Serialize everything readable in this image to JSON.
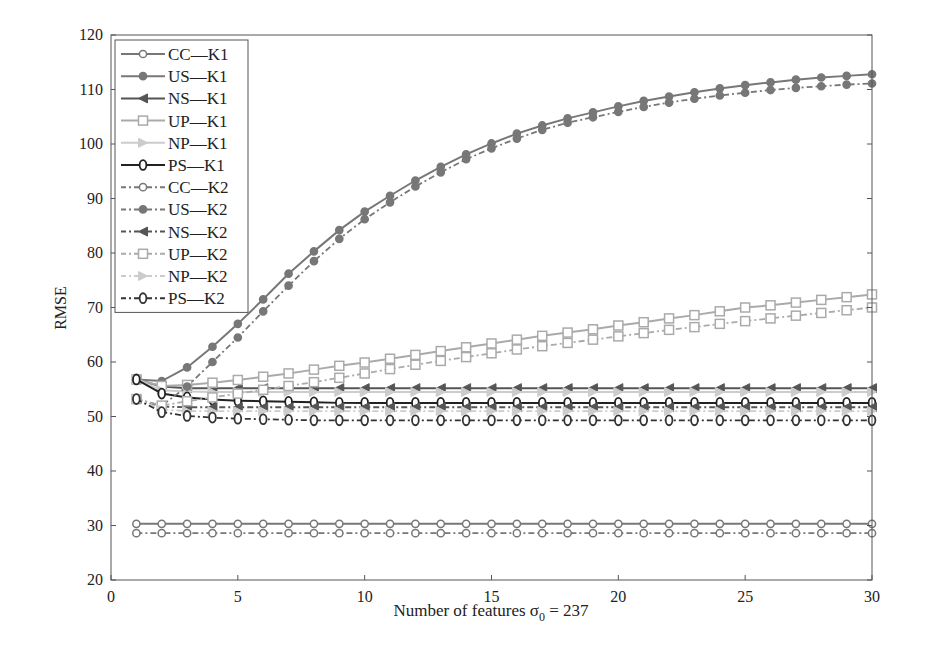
{
  "chart_data": {
    "type": "line",
    "title": "",
    "xlabel": "Number of features σ0 = 237",
    "ylabel": "RMSE",
    "xlim": [
      0,
      30
    ],
    "ylim": [
      20,
      120
    ],
    "xticks": [
      0,
      5,
      10,
      15,
      20,
      25,
      30
    ],
    "yticks": [
      20,
      30,
      40,
      50,
      60,
      70,
      80,
      90,
      100,
      110,
      120
    ],
    "grid": false,
    "legend_position": "upper left",
    "x": [
      1,
      2,
      3,
      4,
      5,
      6,
      7,
      8,
      9,
      10,
      11,
      12,
      13,
      14,
      15,
      16,
      17,
      18,
      19,
      20,
      21,
      22,
      23,
      24,
      25,
      26,
      27,
      28,
      29,
      30
    ],
    "series": [
      {
        "name": "CC—K1",
        "color": "#777",
        "dash": "",
        "marker": "circle",
        "values": [
          30.3,
          30.3,
          30.3,
          30.3,
          30.3,
          30.3,
          30.3,
          30.3,
          30.3,
          30.3,
          30.3,
          30.3,
          30.3,
          30.3,
          30.3,
          30.3,
          30.3,
          30.3,
          30.3,
          30.3,
          30.3,
          30.3,
          30.3,
          30.3,
          30.3,
          30.3,
          30.3,
          30.3,
          30.3,
          30.3
        ]
      },
      {
        "name": "US—K1",
        "color": "#777",
        "dash": "",
        "marker": "dot",
        "values": [
          56.8,
          56.5,
          59,
          62.8,
          67,
          71.5,
          76.2,
          80.3,
          84.2,
          87.6,
          90.5,
          93.3,
          95.8,
          98.1,
          100.1,
          101.9,
          103.4,
          104.7,
          105.8,
          106.9,
          107.9,
          108.7,
          109.5,
          110.2,
          110.8,
          111.3,
          111.8,
          112.2,
          112.5,
          112.8
        ]
      },
      {
        "name": "NS—K1",
        "color": "#555",
        "dash": "",
        "marker": "triangle-left",
        "values": [
          56.8,
          55.5,
          55.2,
          55.2,
          55.2,
          55.2,
          55.2,
          55.2,
          55.2,
          55.2,
          55.2,
          55.2,
          55.2,
          55.2,
          55.2,
          55.2,
          55.2,
          55.2,
          55.2,
          55.2,
          55.2,
          55.2,
          55.2,
          55.2,
          55.2,
          55.2,
          55.2,
          55.2,
          55.2,
          55.2
        ]
      },
      {
        "name": "UP—K1",
        "color": "#aaa",
        "dash": "",
        "marker": "square",
        "values": [
          56.8,
          55.6,
          55.8,
          56.2,
          56.7,
          57.3,
          57.9,
          58.6,
          59.3,
          59.9,
          60.6,
          61.3,
          62,
          62.7,
          63.4,
          64.1,
          64.8,
          65.4,
          66,
          66.7,
          67.3,
          68,
          68.6,
          69.3,
          70,
          70.4,
          70.9,
          71.4,
          71.9,
          72.4
        ]
      },
      {
        "name": "NP—K1",
        "color": "#ccc",
        "dash": "",
        "marker": "triangle-right",
        "values": [
          56.8,
          54.8,
          54.6,
          54.5,
          54.5,
          54.5,
          54.5,
          54.5,
          54.5,
          54.5,
          54.5,
          54.5,
          54.5,
          54.5,
          54.5,
          54.5,
          54.5,
          54.5,
          54.5,
          54.5,
          54.5,
          54.5,
          54.5,
          54.5,
          54.5,
          54.5,
          54.5,
          54.5,
          54.5,
          54.5
        ]
      },
      {
        "name": "PS—K1",
        "color": "#222",
        "dash": "",
        "marker": "diamond",
        "values": [
          56.8,
          54.2,
          53.5,
          53.1,
          52.9,
          52.8,
          52.7,
          52.6,
          52.5,
          52.5,
          52.5,
          52.5,
          52.5,
          52.5,
          52.5,
          52.5,
          52.5,
          52.5,
          52.5,
          52.5,
          52.5,
          52.5,
          52.5,
          52.5,
          52.5,
          52.5,
          52.5,
          52.5,
          52.5,
          52.5
        ]
      },
      {
        "name": "CC—K2",
        "color": "#777",
        "dash": "6,3,2,3",
        "marker": "circle",
        "values": [
          28.6,
          28.6,
          28.6,
          28.6,
          28.6,
          28.6,
          28.6,
          28.6,
          28.6,
          28.6,
          28.6,
          28.6,
          28.6,
          28.6,
          28.6,
          28.6,
          28.6,
          28.6,
          28.6,
          28.6,
          28.6,
          28.6,
          28.6,
          28.6,
          28.6,
          28.6,
          28.6,
          28.6,
          28.6,
          28.6
        ]
      },
      {
        "name": "US—K2",
        "color": "#777",
        "dash": "6,3,2,3",
        "marker": "dot",
        "values": [
          53.2,
          52,
          55.5,
          60,
          64.5,
          69.3,
          74,
          78.5,
          82.6,
          86.2,
          89.3,
          92.2,
          94.8,
          97.2,
          99.2,
          101,
          102.6,
          103.9,
          104.9,
          105.9,
          106.8,
          107.6,
          108.3,
          108.9,
          109.4,
          109.9,
          110.3,
          110.6,
          110.9,
          111.1
        ]
      },
      {
        "name": "NS—K2",
        "color": "#555",
        "dash": "6,3,2,3",
        "marker": "triangle-left",
        "values": [
          53.2,
          51.8,
          51.7,
          51.7,
          51.7,
          51.7,
          51.7,
          51.7,
          51.7,
          51.7,
          51.7,
          51.7,
          51.7,
          51.7,
          51.7,
          51.7,
          51.7,
          51.7,
          51.7,
          51.7,
          51.7,
          51.7,
          51.7,
          51.7,
          51.7,
          51.7,
          51.7,
          51.7,
          51.7,
          51.7
        ]
      },
      {
        "name": "UP—K2",
        "color": "#aaa",
        "dash": "6,3,2,3",
        "marker": "square",
        "values": [
          53.2,
          52,
          52.8,
          53.5,
          54.2,
          54.9,
          55.6,
          56.3,
          57.1,
          57.9,
          58.7,
          59.5,
          60.2,
          60.9,
          61.6,
          62.3,
          62.9,
          63.5,
          64.1,
          64.7,
          65.3,
          65.9,
          66.4,
          67,
          67.5,
          68,
          68.5,
          69,
          69.5,
          70
        ]
      },
      {
        "name": "NP—K2",
        "color": "#ccc",
        "dash": "6,3,2,3",
        "marker": "triangle-right",
        "values": [
          53.2,
          51.3,
          51,
          51,
          51,
          51,
          51,
          51,
          51,
          51,
          51,
          51,
          51,
          51,
          51,
          51,
          51,
          51,
          51,
          51,
          51,
          51,
          51,
          51,
          51,
          51,
          51,
          51,
          51,
          51
        ]
      },
      {
        "name": "PS—K2",
        "color": "#333",
        "dash": "6,3,2,3",
        "marker": "diamond",
        "values": [
          53.2,
          50.8,
          50.1,
          49.8,
          49.6,
          49.5,
          49.4,
          49.3,
          49.3,
          49.3,
          49.3,
          49.3,
          49.3,
          49.3,
          49.3,
          49.3,
          49.3,
          49.3,
          49.3,
          49.3,
          49.3,
          49.3,
          49.3,
          49.3,
          49.3,
          49.3,
          49.3,
          49.3,
          49.3,
          49.3
        ]
      }
    ]
  }
}
